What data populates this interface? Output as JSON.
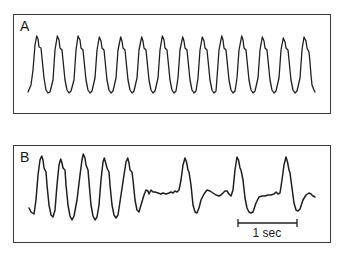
{
  "figure": {
    "panels": [
      {
        "id": "A",
        "label": "A",
        "description": "Regular periodic waveform, 14 cycles",
        "points": [
          [
            28,
            92
          ],
          [
            31,
            85
          ],
          [
            33,
            70
          ],
          [
            35,
            45
          ],
          [
            36.7,
            36
          ],
          [
            38,
            39
          ],
          [
            39,
            47
          ],
          [
            41,
            48
          ],
          [
            42,
            58
          ],
          [
            44,
            78
          ],
          [
            46,
            90
          ],
          [
            48,
            93
          ],
          [
            50,
            92
          ],
          [
            53,
            80
          ],
          [
            55,
            50
          ],
          [
            57.3,
            36
          ],
          [
            59,
            40
          ],
          [
            60,
            48
          ],
          [
            62,
            50
          ],
          [
            63,
            60
          ],
          [
            65,
            80
          ],
          [
            67,
            90
          ],
          [
            69,
            93
          ],
          [
            71,
            91
          ],
          [
            74,
            80
          ],
          [
            76,
            50
          ],
          [
            78,
            36
          ],
          [
            80,
            40
          ],
          [
            81,
            48
          ],
          [
            83,
            50
          ],
          [
            84,
            60
          ],
          [
            86,
            80
          ],
          [
            88,
            90
          ],
          [
            90,
            93
          ],
          [
            92,
            91
          ],
          [
            95,
            78
          ],
          [
            97,
            50
          ],
          [
            99.3,
            37
          ],
          [
            101,
            41
          ],
          [
            102,
            48
          ],
          [
            104,
            50
          ],
          [
            105,
            60
          ],
          [
            107,
            80
          ],
          [
            109,
            90
          ],
          [
            111,
            93
          ],
          [
            113,
            91
          ],
          [
            116,
            78
          ],
          [
            118,
            50
          ],
          [
            120.7,
            37
          ],
          [
            122,
            41
          ],
          [
            123,
            48
          ],
          [
            125,
            50
          ],
          [
            126,
            60
          ],
          [
            128,
            80
          ],
          [
            130,
            90
          ],
          [
            132,
            93
          ],
          [
            134,
            91
          ],
          [
            137,
            78
          ],
          [
            139,
            50
          ],
          [
            141.7,
            37
          ],
          [
            143,
            41
          ],
          [
            144,
            48
          ],
          [
            146,
            50
          ],
          [
            147,
            60
          ],
          [
            149,
            80
          ],
          [
            151,
            90
          ],
          [
            153,
            93
          ],
          [
            155,
            91
          ],
          [
            158,
            78
          ],
          [
            160,
            50
          ],
          [
            162.3,
            36
          ],
          [
            164,
            40
          ],
          [
            165,
            48
          ],
          [
            167,
            50
          ],
          [
            168,
            60
          ],
          [
            170,
            80
          ],
          [
            172,
            90
          ],
          [
            174,
            93
          ],
          [
            176,
            91
          ],
          [
            178,
            78
          ],
          [
            180,
            50
          ],
          [
            182.7,
            37
          ],
          [
            184,
            41
          ],
          [
            185,
            48
          ],
          [
            187,
            50
          ],
          [
            188,
            60
          ],
          [
            190,
            80
          ],
          [
            192,
            90
          ],
          [
            194,
            93
          ],
          [
            196,
            91
          ],
          [
            198,
            78
          ],
          [
            200,
            50
          ],
          [
            202.3,
            37
          ],
          [
            204,
            41
          ],
          [
            205,
            48
          ],
          [
            207,
            50
          ],
          [
            208,
            60
          ],
          [
            210,
            80
          ],
          [
            212,
            90
          ],
          [
            214,
            93
          ],
          [
            216,
            91
          ],
          [
            217,
            78
          ],
          [
            219,
            50
          ],
          [
            221.7,
            36
          ],
          [
            223,
            40
          ],
          [
            224,
            48
          ],
          [
            226,
            50
          ],
          [
            227,
            60
          ],
          [
            229,
            80
          ],
          [
            231,
            90
          ],
          [
            233,
            93
          ],
          [
            235,
            91
          ],
          [
            237,
            78
          ],
          [
            239,
            50
          ],
          [
            241.7,
            36
          ],
          [
            243,
            40
          ],
          [
            244,
            48
          ],
          [
            246,
            50
          ],
          [
            247,
            60
          ],
          [
            249,
            80
          ],
          [
            251,
            90
          ],
          [
            253,
            93
          ],
          [
            255,
            91
          ],
          [
            258,
            78
          ],
          [
            260,
            50
          ],
          [
            262.3,
            37
          ],
          [
            264,
            41
          ],
          [
            265,
            48
          ],
          [
            267,
            50
          ],
          [
            268,
            60
          ],
          [
            270,
            80
          ],
          [
            272,
            90
          ],
          [
            274,
            93
          ],
          [
            276,
            91
          ],
          [
            279,
            78
          ],
          [
            281,
            50
          ],
          [
            283.3,
            38
          ],
          [
            285,
            42
          ],
          [
            286,
            48
          ],
          [
            288,
            50
          ],
          [
            289,
            60
          ],
          [
            291,
            80
          ],
          [
            293,
            90
          ],
          [
            295,
            93
          ],
          [
            297,
            91
          ],
          [
            300,
            78
          ],
          [
            302,
            50
          ],
          [
            304,
            37
          ],
          [
            306,
            41
          ],
          [
            307,
            48
          ],
          [
            309,
            52
          ],
          [
            310,
            62
          ],
          [
            311,
            75
          ],
          [
            312,
            85
          ],
          [
            314,
            90
          ],
          [
            315,
            92
          ]
        ]
      },
      {
        "id": "B",
        "label": "B",
        "description": "Five regular cycles followed by irregular, widely spaced beats",
        "points": [
          [
            29,
            208
          ],
          [
            31,
            212
          ],
          [
            34,
            214
          ],
          [
            36,
            200
          ],
          [
            38,
            175
          ],
          [
            40,
            160
          ],
          [
            41.7,
            156
          ],
          [
            43,
            160
          ],
          [
            44,
            168
          ],
          [
            46,
            172
          ],
          [
            47,
            185
          ],
          [
            49,
            205
          ],
          [
            51,
            215
          ],
          [
            53,
            217
          ],
          [
            55,
            210
          ],
          [
            57,
            185
          ],
          [
            59,
            165
          ],
          [
            60.7,
            159
          ],
          [
            62,
            163
          ],
          [
            63,
            168
          ],
          [
            65,
            170
          ],
          [
            66,
            185
          ],
          [
            68,
            205
          ],
          [
            70,
            216
          ],
          [
            72,
            220
          ],
          [
            74,
            216
          ],
          [
            77,
            200
          ],
          [
            80,
            175
          ],
          [
            82,
            160
          ],
          [
            83.3,
            154
          ],
          [
            85,
            158
          ],
          [
            86,
            165
          ],
          [
            88,
            170
          ],
          [
            89,
            182
          ],
          [
            91,
            205
          ],
          [
            93,
            216
          ],
          [
            95,
            220
          ],
          [
            97,
            217
          ],
          [
            99,
            205
          ],
          [
            101,
            180
          ],
          [
            103,
            162
          ],
          [
            104.3,
            158
          ],
          [
            106,
            164
          ],
          [
            107,
            168
          ],
          [
            109,
            172
          ],
          [
            110,
            185
          ],
          [
            112,
            205
          ],
          [
            114,
            215
          ],
          [
            116,
            218
          ],
          [
            118,
            215
          ],
          [
            121,
            195
          ],
          [
            124,
            175
          ],
          [
            126,
            162
          ],
          [
            127.7,
            158
          ],
          [
            129,
            163
          ],
          [
            130,
            170
          ],
          [
            132,
            172
          ],
          [
            133,
            180
          ],
          [
            135,
            200
          ],
          [
            137,
            210
          ],
          [
            139,
            212
          ],
          [
            141,
            205
          ],
          [
            144,
            195
          ],
          [
            146,
            190
          ],
          [
            148,
            191
          ],
          [
            149,
            194
          ],
          [
            151,
            190
          ],
          [
            153,
            192
          ],
          [
            155,
            192
          ],
          [
            158,
            193
          ],
          [
            161,
            194
          ],
          [
            163,
            193
          ],
          [
            166,
            194
          ],
          [
            169,
            193
          ],
          [
            171,
            192
          ],
          [
            173,
            193
          ],
          [
            175,
            191
          ],
          [
            177,
            192
          ],
          [
            179,
            190
          ],
          [
            181,
            180
          ],
          [
            183,
            165
          ],
          [
            185,
            158
          ],
          [
            186.5,
            162
          ],
          [
            188,
            170
          ],
          [
            189,
            172
          ],
          [
            191,
            185
          ],
          [
            193,
            205
          ],
          [
            195,
            212
          ],
          [
            197,
            213
          ],
          [
            199,
            208
          ],
          [
            201,
            200
          ],
          [
            204,
            194
          ],
          [
            207,
            190
          ],
          [
            210,
            191
          ],
          [
            213,
            193
          ],
          [
            216,
            195
          ],
          [
            219,
            196
          ],
          [
            221,
            195
          ],
          [
            223,
            193
          ],
          [
            225,
            191
          ],
          [
            227,
            191
          ],
          [
            229,
            194
          ],
          [
            231,
            196
          ],
          [
            233,
            190
          ],
          [
            235,
            170
          ],
          [
            237,
            157
          ],
          [
            238.5,
            160
          ],
          [
            240,
            168
          ],
          [
            241,
            170
          ],
          [
            243,
            180
          ],
          [
            245,
            198
          ],
          [
            247,
            208
          ],
          [
            249,
            212
          ],
          [
            251,
            213
          ],
          [
            253,
            212
          ],
          [
            256,
            203
          ],
          [
            259,
            197
          ],
          [
            262,
            196
          ],
          [
            265,
            196
          ],
          [
            268,
            195
          ],
          [
            271,
            195
          ],
          [
            274,
            194
          ],
          [
            276,
            192
          ],
          [
            278,
            194
          ],
          [
            280,
            193
          ],
          [
            282,
            180
          ],
          [
            284,
            165
          ],
          [
            286,
            157
          ],
          [
            287.5,
            162
          ],
          [
            289,
            170
          ],
          [
            290,
            173
          ],
          [
            292,
            188
          ],
          [
            294,
            203
          ],
          [
            296,
            210
          ],
          [
            298,
            211
          ],
          [
            300,
            209
          ],
          [
            303,
            200
          ],
          [
            306,
            195
          ],
          [
            309,
            193
          ],
          [
            311,
            194
          ],
          [
            313,
            196
          ],
          [
            315,
            197
          ]
        ]
      }
    ],
    "scale_bar": {
      "label": "1 sec",
      "x1": 238,
      "x2": 297,
      "y": 223,
      "tick_height": 8
    },
    "colors": {
      "trace": "#1f1f1f",
      "border": "#3a3a3a",
      "background": "#ffffff"
    }
  }
}
